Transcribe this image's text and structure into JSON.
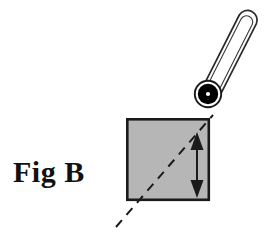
{
  "figure": {
    "caption": "Fig B",
    "domain_note": "line-art technical illustration",
    "colors": {
      "background": "#ffffff",
      "square_fill": "#b6b6b6",
      "square_stroke": "#1a1a1a",
      "line_stroke": "#1a1a1a",
      "bulb_fill": "#000000",
      "bulb_highlight": "#ffffff",
      "rod_fill": "#ffffff",
      "caption_color": "#111111"
    },
    "elements": {
      "square": {
        "name": "gray-square",
        "x": 126,
        "y": 118,
        "width": 84,
        "height": 83,
        "stroke_width": 2.6
      },
      "dashed_diagonal": {
        "name": "dashed-diagonal-line",
        "x1": 116,
        "y1": 227,
        "x2": 213,
        "y2": 115,
        "dash_pattern": "9 7",
        "stroke_width": 2
      },
      "double_arrow": {
        "name": "double-headed-arrow",
        "x": 197,
        "y_top": 133,
        "y_bottom": 197,
        "shaft_width": 2,
        "head_half_width": 7,
        "head_length": 15
      },
      "probe_rod": {
        "name": "probe-rod",
        "tip_x": 248,
        "tip_y": 24,
        "base_x": 212,
        "base_y": 89,
        "half_width": 9,
        "outer_stroke_width": 1.6,
        "inner_stroke_width": 1.1
      },
      "probe_bulb": {
        "name": "probe-bulb",
        "cx": 208,
        "cy": 94,
        "outer_ring_r": 14,
        "outer_ring_stroke": 1.8,
        "disk_r": 10.5,
        "highlight_r": 2.2
      }
    }
  }
}
